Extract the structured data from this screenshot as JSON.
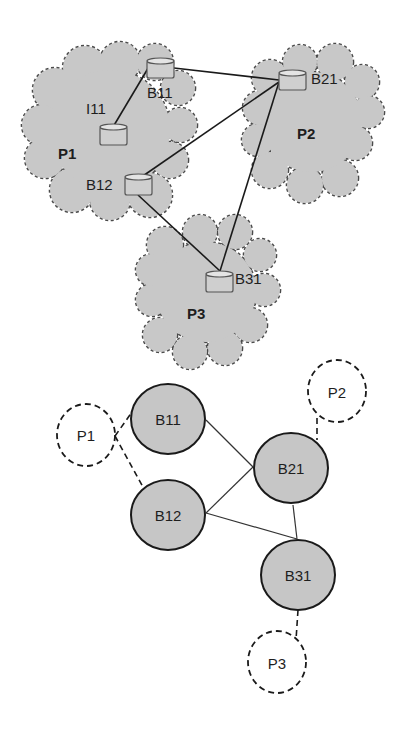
{
  "diagram": {
    "upper": {
      "clouds": [
        {
          "id": "P1",
          "label": "P1"
        },
        {
          "id": "P2",
          "label": "P2"
        },
        {
          "id": "P3",
          "label": "P3"
        }
      ],
      "devices": [
        {
          "id": "B11",
          "label": "B11"
        },
        {
          "id": "I11",
          "label": "I11"
        },
        {
          "id": "B12",
          "label": "B12"
        },
        {
          "id": "B21",
          "label": "B21"
        },
        {
          "id": "B31",
          "label": "B31"
        }
      ],
      "links": [
        [
          "I11",
          "B11"
        ],
        [
          "B11",
          "B21"
        ],
        [
          "B12",
          "B21"
        ],
        [
          "B12",
          "B31"
        ],
        [
          "B21",
          "B31"
        ]
      ]
    },
    "lower": {
      "border_nodes": [
        {
          "id": "B11",
          "label": "B11"
        },
        {
          "id": "B12",
          "label": "B12"
        },
        {
          "id": "B21",
          "label": "B21"
        },
        {
          "id": "B31",
          "label": "B31"
        }
      ],
      "peer_nodes": [
        {
          "id": "P1",
          "label": "P1"
        },
        {
          "id": "P2",
          "label": "P2"
        },
        {
          "id": "P3",
          "label": "P3"
        }
      ],
      "solid_links": [
        [
          "B11",
          "B21"
        ],
        [
          "B12",
          "B21"
        ],
        [
          "B12",
          "B31"
        ],
        [
          "B21",
          "B31"
        ]
      ],
      "dashed_links": [
        [
          "P1",
          "B11"
        ],
        [
          "P1",
          "B12"
        ],
        [
          "P2",
          "B21"
        ],
        [
          "P3",
          "B31"
        ]
      ]
    },
    "colors": {
      "cloud_fill": "#c8c8c8",
      "node_fill": "#c6c6c6",
      "stroke": "#1a1a1a"
    }
  }
}
